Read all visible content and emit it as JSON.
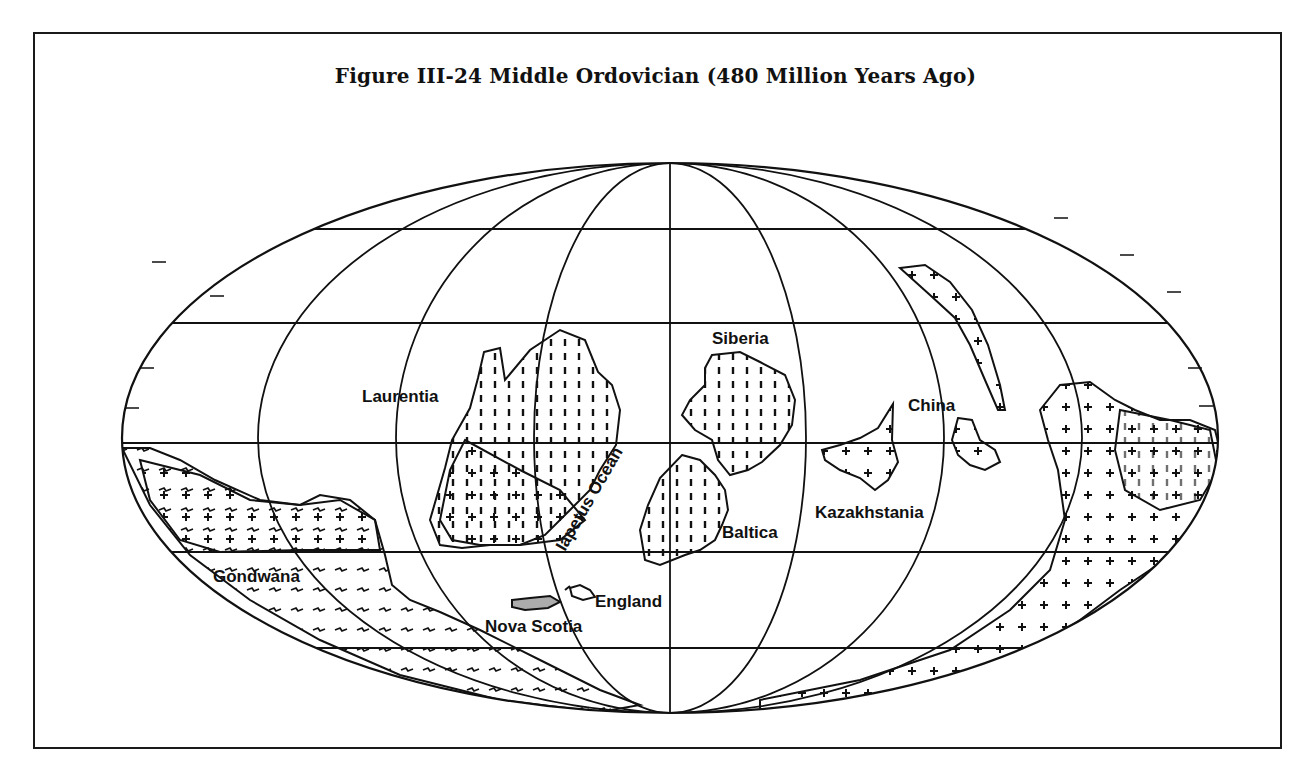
{
  "figure": {
    "title": "Figure III-24  Middle Ordovician (480 Million Years Ago)"
  },
  "map": {
    "projection": "elliptical (Mollweide-style) world projection",
    "graticule": {
      "parallels_count": 5,
      "meridians_count": 7
    },
    "labels": {
      "laurentia": "Laurentia",
      "siberia": "Siberia",
      "china": "China",
      "kazakhstania": "Kazakhstania",
      "baltica": "Baltica",
      "iapetus_ocean": "Iapetus Ocean",
      "gondwana": "Gondwana",
      "england": "England",
      "nova_scotia": "Nova Scotia"
    },
    "colors": {
      "ink": "#111111",
      "paper": "#ffffff"
    }
  }
}
